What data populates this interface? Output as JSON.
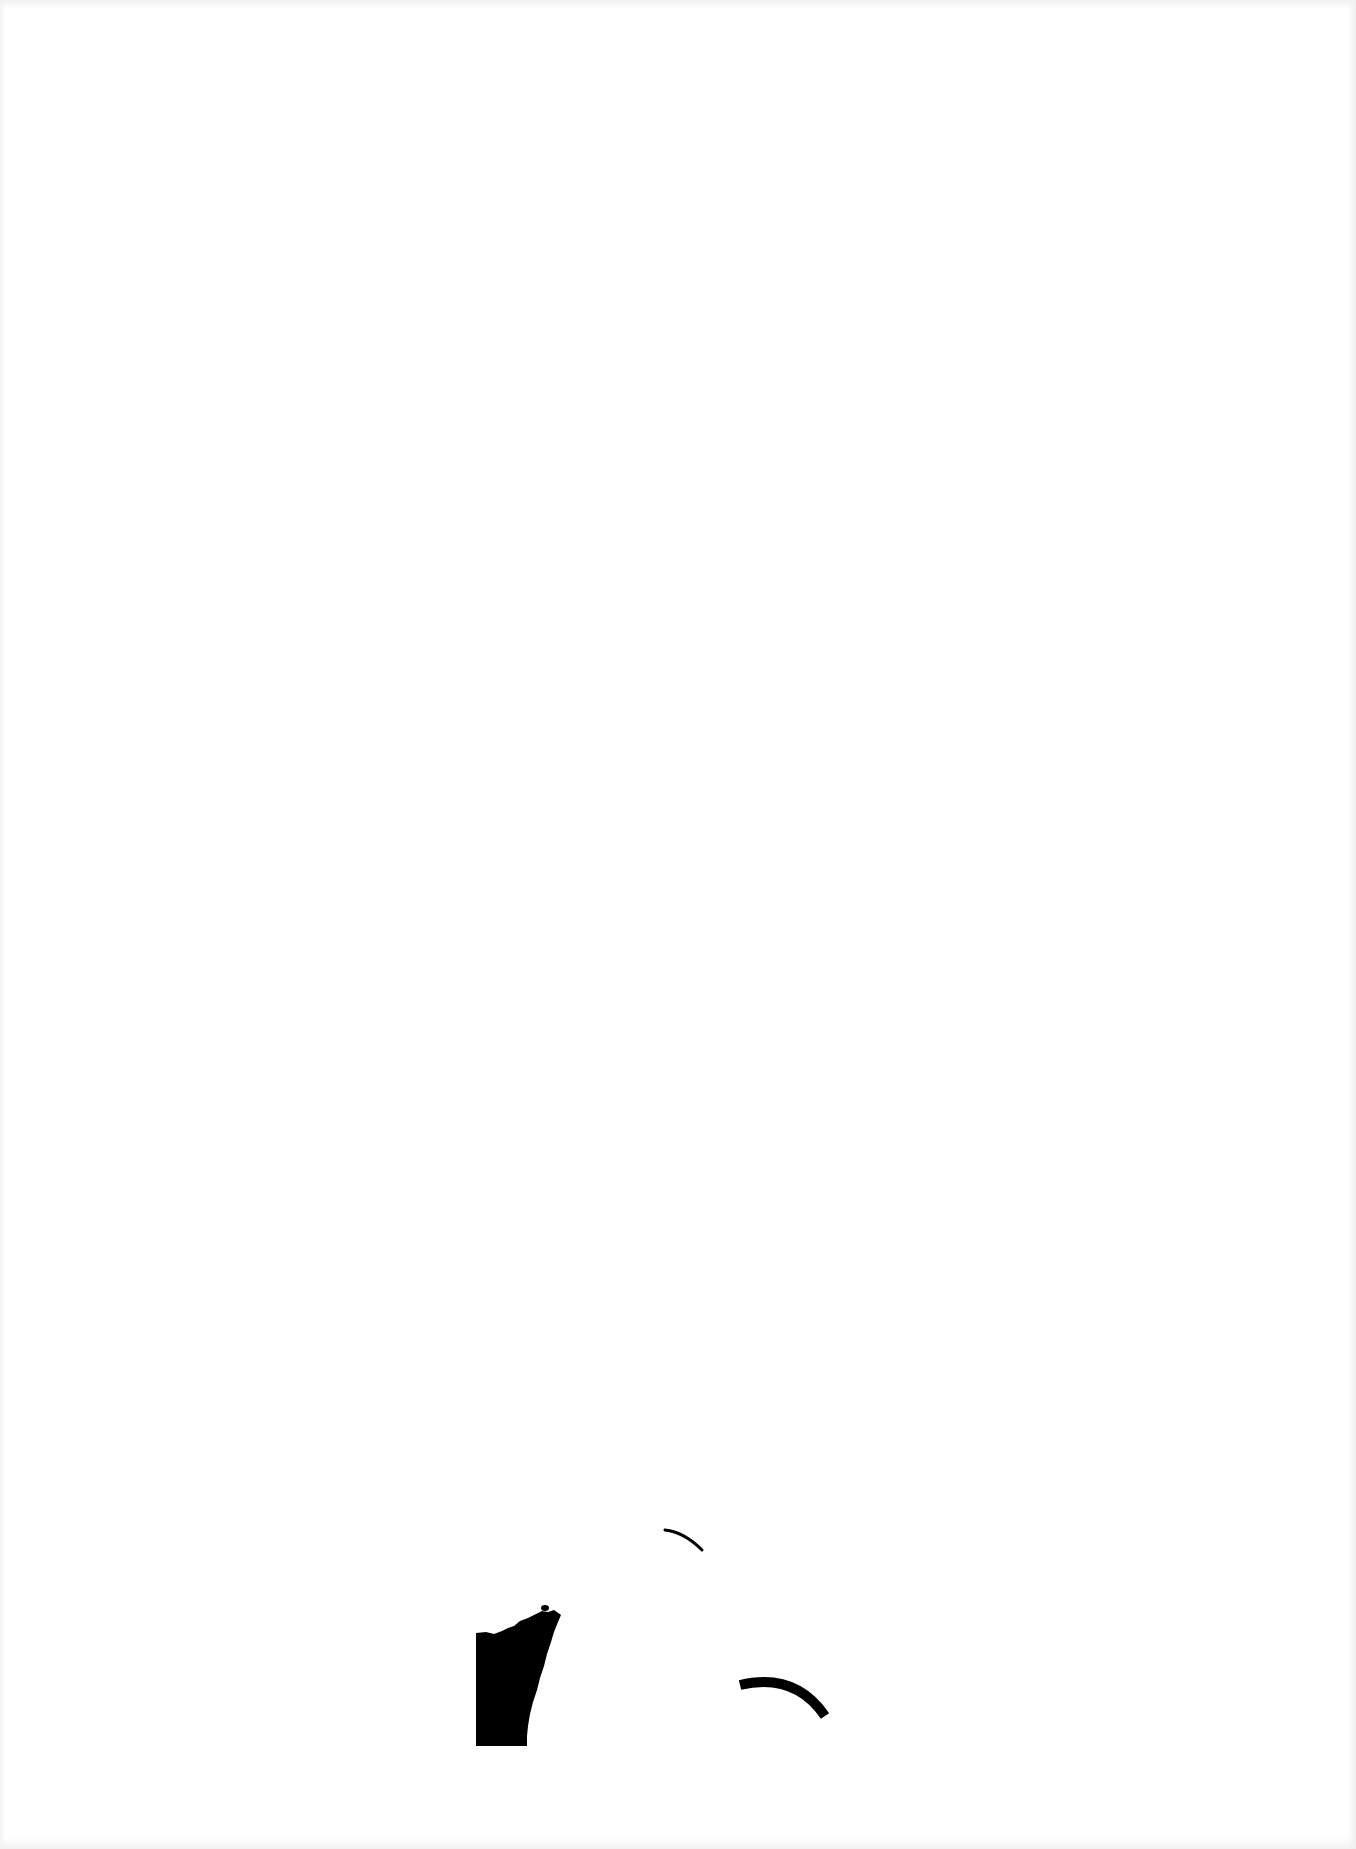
{
  "page": {
    "background_color": "#ffffff",
    "ink_color": "#000000"
  },
  "marks": [
    {
      "name": "block-shape",
      "kind": "filled-irregular-block"
    },
    {
      "name": "small-dot",
      "kind": "dot"
    },
    {
      "name": "upper-arc",
      "kind": "thin-arc-stroke"
    },
    {
      "name": "lower-arc",
      "kind": "thick-arc-stroke"
    }
  ]
}
